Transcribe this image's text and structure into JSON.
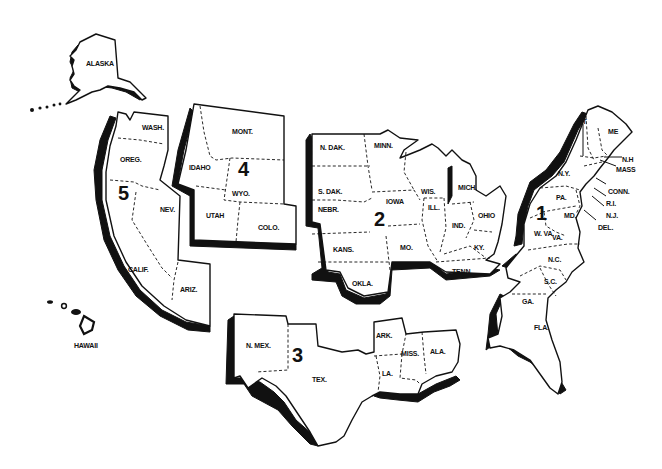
{
  "map": {
    "colors": {
      "ink": "#111111",
      "paper": "#ffffff"
    },
    "regions": [
      {
        "number": "1",
        "states": [
          "VT",
          "ME",
          "N.H",
          "MASS",
          "N.Y.",
          "CONN.",
          "R.I.",
          "PA.",
          "N.J.",
          "MD.",
          "DEL.",
          "W. VA.",
          "VA.",
          "N.C.",
          "S.C.",
          "GA.",
          "FLA."
        ]
      },
      {
        "number": "2",
        "states": [
          "N. DAK.",
          "MINN.",
          "S. DAK.",
          "WIS.",
          "MICH.",
          "IOWA",
          "NEBR.",
          "ILL.",
          "IND.",
          "OHIO",
          "KANS.",
          "MO.",
          "KY.",
          "TENN.",
          "OKLA."
        ]
      },
      {
        "number": "3",
        "states": [
          "N. MEX.",
          "TEX.",
          "ARK.",
          "MISS.",
          "ALA.",
          "LA."
        ]
      },
      {
        "number": "4",
        "states": [
          "MONT.",
          "IDAHO",
          "WYO.",
          "UTAH",
          "COLO."
        ]
      },
      {
        "number": "5",
        "states": [
          "ALASKA",
          "WASH.",
          "OREG.",
          "NEV.",
          "CALIF.",
          "ARIZ.",
          "HAWAII"
        ]
      }
    ]
  }
}
